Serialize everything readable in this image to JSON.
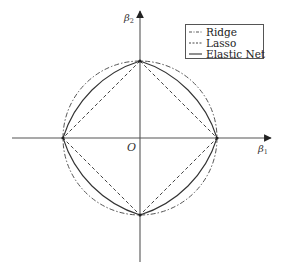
{
  "diagram": {
    "title": "",
    "axes": {
      "x_label": "β",
      "x_label_sub": "1",
      "y_label": "β",
      "y_label_sub": "2",
      "origin_label": "O"
    },
    "legend": {
      "items": [
        {
          "label": "Ridge",
          "style": "dash-dot"
        },
        {
          "label": "Lasso",
          "style": "dashed"
        },
        {
          "label": "Elastic Net",
          "style": "solid"
        }
      ]
    },
    "colors": {
      "axis": "#444444",
      "ridge": "#555555",
      "lasso": "#444444",
      "elastic_net": "#333333",
      "legend_border": "#555555"
    },
    "shapes": {
      "ridge": "circle |β1|^2 + |β2|^2 = t",
      "lasso": "diamond |β1| + |β2| = t",
      "elastic_net": "rounded diamond between Lasso and Ridge"
    }
  }
}
